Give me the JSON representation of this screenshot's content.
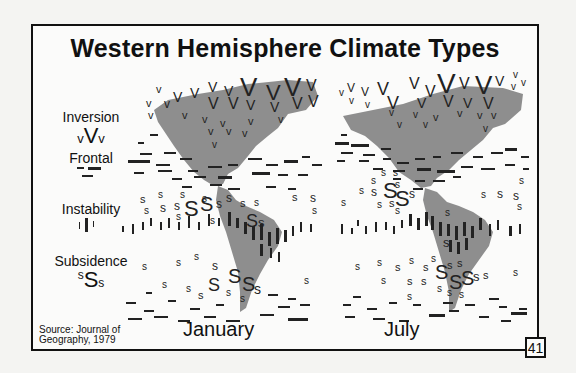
{
  "slide": {
    "title": "Western Hemisphere Climate Types",
    "page_number": "41",
    "source_line1": "Source: Journal of",
    "source_line2": "Geography, 1979"
  },
  "legend": [
    {
      "label": "Inversion",
      "symbol_small": "v",
      "symbol_large": "V"
    },
    {
      "label": "Frontal",
      "symbol": "dash"
    },
    {
      "label": "Instability",
      "symbol": "bar"
    },
    {
      "label": "Subsidence",
      "symbol_small": "s",
      "symbol_large": "S"
    }
  ],
  "maps": [
    {
      "label": "January"
    },
    {
      "label": "July"
    }
  ],
  "colors": {
    "land": "#8e8e8e",
    "ink": "#222222",
    "background": "#fbfbfa"
  }
}
